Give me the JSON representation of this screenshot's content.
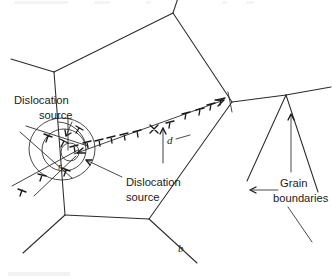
{
  "figure": {
    "background_color": "#ffffff",
    "ink_color": "#1a1a1a",
    "labels": {
      "dislocation_source_upper_line1": "Dislocation",
      "dislocation_source_upper_line2": "source",
      "dislocation_source_lower_line1": "Dislocation",
      "dislocation_source_lower_line2": "source",
      "grain_boundaries_line1": "Grain",
      "grain_boundaries_line2": "boundaries",
      "pileup_distance": "d",
      "source_radius": "r",
      "burgers_vector": "b"
    },
    "geometry": {
      "grain_polygon": [
        [
          54,
          72
        ],
        [
          173,
          13
        ],
        [
          232,
          102
        ],
        [
          149,
          219
        ],
        [
          65,
          215
        ]
      ],
      "external_boundary_stubs": [
        [
          [
            54,
            72
          ],
          [
            10,
            60
          ]
        ],
        [
          [
            173,
            13
          ],
          [
            178,
            0
          ]
        ],
        [
          [
            232,
            102
          ],
          [
            286,
            95
          ]
        ],
        [
          [
            149,
            219
          ],
          [
            196,
            262
          ]
        ],
        [
          [
            65,
            215
          ],
          [
            24,
            252
          ]
        ]
      ],
      "right_grain_vertex": [
        286,
        95
      ],
      "right_grain_edges": [
        [
          [
            286,
            95
          ],
          [
            330,
            88
          ]
        ],
        [
          [
            286,
            95
          ],
          [
            248,
            180
          ]
        ],
        [
          [
            286,
            95
          ],
          [
            316,
            190
          ]
        ]
      ],
      "source_center": [
        66,
        148
      ],
      "source_radii": [
        8,
        20,
        32
      ],
      "slip_plane_main": [
        [
          70,
          150
        ],
        [
          226,
          99
        ]
      ],
      "pileup_arrow_tip": [
        222,
        100
      ],
      "dimension_tick_x": 163
    },
    "dislocation_symbols": {
      "count_main_row": 14,
      "glyph_primary": "⊥",
      "glyph_flipped": "⊤",
      "glyph_source_marker": "×"
    },
    "arrows": {
      "grain_boundary_arrow_left": {
        "from": [
          280,
          188
        ],
        "to": [
          247,
          181
        ]
      },
      "grain_boundary_arrow_up": {
        "from": [
          291,
          150
        ],
        "to": [
          291,
          112
        ]
      },
      "grain_boundary_arrow_lower": {
        "from": [
          281,
          205
        ],
        "to": [
          300,
          232
        ]
      }
    }
  }
}
